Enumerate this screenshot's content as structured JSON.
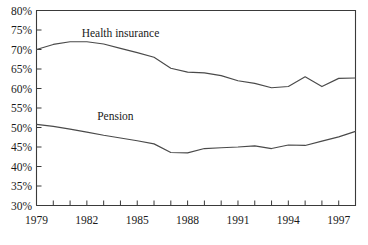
{
  "chart_data": {
    "type": "line",
    "title": "",
    "subtitle": "",
    "xlabel": "",
    "ylabel": "",
    "xlim": [
      1979,
      1998
    ],
    "ylim": [
      30,
      80
    ],
    "y_tick_step": 5,
    "x_tick_step": 1,
    "x_label_step": 3,
    "grid": false,
    "legend_position": "inline-annotation",
    "y_tick_labels": [
      "30%",
      "35%",
      "40%",
      "45%",
      "50%",
      "55%",
      "60%",
      "65%",
      "70%",
      "75%",
      "80%"
    ],
    "y_tick_values": [
      30,
      35,
      40,
      45,
      50,
      55,
      60,
      65,
      70,
      75,
      80
    ],
    "x_tick_values": [
      1979,
      1980,
      1981,
      1982,
      1983,
      1984,
      1985,
      1986,
      1987,
      1988,
      1989,
      1990,
      1991,
      1992,
      1993,
      1994,
      1995,
      1996,
      1997,
      1998
    ],
    "x_tick_labels": [
      "1979",
      "",
      "",
      "1982",
      "",
      "",
      "1985",
      "",
      "",
      "1988",
      "",
      "",
      "1991",
      "",
      "",
      "1994",
      "",
      "",
      "1997",
      ""
    ],
    "x_labeled_values": [
      1979,
      1982,
      1985,
      1988,
      1991,
      1994,
      1997
    ],
    "x_labeled_text": [
      "1979",
      "1982",
      "1985",
      "1988",
      "1991",
      "1994",
      "1997"
    ],
    "x": [
      1979,
      1980,
      1981,
      1982,
      1983,
      1984,
      1985,
      1986,
      1987,
      1988,
      1989,
      1990,
      1991,
      1992,
      1993,
      1994,
      1995,
      1996,
      1997,
      1998
    ],
    "series": [
      {
        "name": "Health insurance",
        "color": "#4a4a4a",
        "label_x": 1984.0,
        "label_y": 73.3,
        "values": [
          70.0,
          71.3,
          72.0,
          72.0,
          71.4,
          70.3,
          69.2,
          68.0,
          65.2,
          64.2,
          64.0,
          63.3,
          62.0,
          61.3,
          60.2,
          60.5,
          63.0,
          60.5,
          62.6,
          62.7
        ]
      },
      {
        "name": "Pension",
        "color": "#4a4a4a",
        "label_x": 1983.7,
        "label_y": 52.0,
        "values": [
          50.8,
          50.3,
          49.6,
          48.8,
          48.0,
          47.3,
          46.6,
          45.8,
          43.6,
          43.5,
          44.6,
          44.8,
          45.0,
          45.3,
          44.6,
          45.5,
          45.4,
          46.5,
          47.6,
          49.0
        ]
      }
    ]
  }
}
